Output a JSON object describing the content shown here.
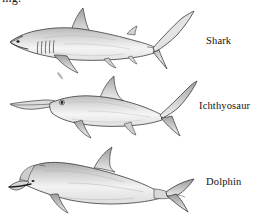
{
  "figure": {
    "background_color": "#ffffff",
    "ink_color": "#2b2b2b",
    "fill_light": "#f2f2f2",
    "fill_mid": "#d8d8d8",
    "fill_dark": "#a8a8a8",
    "clipped_caption_fragment": "ing.",
    "label_color": "#111111"
  },
  "specimens": [
    {
      "id": "shark",
      "label": "Shark",
      "features": [
        "pointed-snout",
        "eye",
        "mouth",
        "five-gill-slits",
        "dorsal-fin",
        "pectoral-fin",
        "pelvic-fin",
        "second-dorsal-fin",
        "heterocercal-tail"
      ]
    },
    {
      "id": "ichthyosaur",
      "label": "Ichthyosaur",
      "features": [
        "long-rostrum",
        "large-round-eye",
        "dorsal-fin",
        "front-flipper",
        "rear-flipper",
        "crescent-tail-fluke"
      ]
    },
    {
      "id": "dolphin",
      "label": "Dolphin",
      "features": [
        "melon-forehead",
        "short-beak",
        "mouth-line",
        "eye",
        "blowhole",
        "curved-dorsal-fin",
        "pectoral-flipper",
        "horizontal-tail-fluke"
      ]
    }
  ]
}
